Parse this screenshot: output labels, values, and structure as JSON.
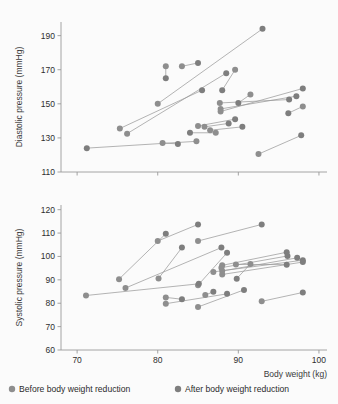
{
  "figure": {
    "width": 338,
    "height": 404,
    "background": "#fbfbfb",
    "marker_color_before": "#8e8e8e",
    "marker_color_after": "#7e7e7e",
    "link_color": "#9b9b9b",
    "axis_color": "#9a9a9a"
  },
  "legend": {
    "position": "bottom",
    "items": [
      {
        "label": "Before body weight reduction",
        "marker": "circle",
        "color": "#8e8e8e"
      },
      {
        "label": "After body weight reduction",
        "marker": "circle",
        "color": "#7e7e7e"
      }
    ]
  },
  "chart_data": [
    {
      "type": "scatter",
      "panel": "top",
      "title": "",
      "xlabel": "",
      "ylabel": "Diastolic pressure (mmHg)",
      "xlim": [
        68,
        101
      ],
      "ylim": [
        110,
        198
      ],
      "xticks": [
        70,
        80,
        90,
        100
      ],
      "xticklabels": [
        "",
        "",
        "",
        ""
      ],
      "yticks": [
        110,
        130,
        150,
        170,
        190
      ],
      "yticklabels": [
        "110",
        "130",
        "150",
        "170",
        "190"
      ],
      "grid": false,
      "series": [
        {
          "name": "Before body weight reduction",
          "role": "before"
        },
        {
          "name": "After body weight reduction",
          "role": "after"
        }
      ],
      "pairs": [
        {
          "before": [
            80.0,
            150.0
          ],
          "after": [
            93.0,
            194.0
          ]
        },
        {
          "before": [
            83.0,
            172.0
          ],
          "after": [
            85.0,
            174.0
          ]
        },
        {
          "before": [
            81.0,
            172.0
          ],
          "after": [
            81.0,
            165.0
          ]
        },
        {
          "before": [
            75.3,
            135.5
          ],
          "after": [
            85.5,
            158.0
          ]
        },
        {
          "before": [
            76.2,
            132.5
          ],
          "after": [
            88.5,
            168.0
          ]
        },
        {
          "before": [
            89.6,
            170.0
          ],
          "after": [
            88.0,
            158.0
          ]
        },
        {
          "before": [
            87.7,
            150.5
          ],
          "after": [
            96.3,
            152.5
          ]
        },
        {
          "before": [
            87.8,
            147.0
          ],
          "after": [
            97.2,
            154.5
          ]
        },
        {
          "before": [
            87.8,
            145.5
          ],
          "after": [
            98.0,
            159.0
          ]
        },
        {
          "before": [
            98.0,
            148.5
          ],
          "after": [
            96.2,
            144.5
          ]
        },
        {
          "before": [
            91.5,
            155.5
          ],
          "after": [
            90.0,
            150.5
          ]
        },
        {
          "before": [
            85.8,
            136.5
          ],
          "after": [
            88.8,
            138.5
          ]
        },
        {
          "before": [
            85.0,
            137.0
          ],
          "after": [
            89.6,
            141.0
          ]
        },
        {
          "before": [
            86.5,
            134.5
          ],
          "after": [
            90.5,
            136.5
          ]
        },
        {
          "before": [
            87.2,
            133.0
          ],
          "after": [
            84.0,
            133.0
          ]
        },
        {
          "before": [
            80.6,
            127.0
          ],
          "after": [
            82.5,
            126.5
          ]
        },
        {
          "before": [
            84.8,
            128.0
          ],
          "after": [
            71.2,
            124.0
          ]
        },
        {
          "before": [
            92.5,
            120.5
          ],
          "after": [
            97.8,
            131.5
          ]
        }
      ]
    },
    {
      "type": "scatter",
      "panel": "bottom",
      "title": "",
      "xlabel": "Body weight (kg)",
      "ylabel": "Systolic pressure (mmHg)",
      "xlim": [
        68,
        101
      ],
      "ylim": [
        60,
        122
      ],
      "xticks": [
        70,
        80,
        90,
        100
      ],
      "xticklabels": [
        "70",
        "80",
        "90",
        "100"
      ],
      "yticks": [
        60,
        70,
        80,
        90,
        100,
        110,
        120
      ],
      "yticklabels": [
        "60",
        "70",
        "80",
        "90",
        "100",
        "110",
        "120"
      ],
      "grid": false,
      "series": [
        {
          "name": "Before body weight reduction",
          "role": "before"
        },
        {
          "name": "After body weight reduction",
          "role": "after"
        }
      ],
      "pairs": [
        {
          "before": [
            75.2,
            90.3
          ],
          "after": [
            81.0,
            109.7
          ]
        },
        {
          "before": [
            80.0,
            106.6
          ],
          "after": [
            85.0,
            113.7
          ]
        },
        {
          "before": [
            80.1,
            90.6
          ],
          "after": [
            83.0,
            103.8
          ]
        },
        {
          "before": [
            85.0,
            106.6
          ],
          "after": [
            92.9,
            113.7
          ]
        },
        {
          "before": [
            76.0,
            86.5
          ],
          "after": [
            87.9,
            103.8
          ]
        },
        {
          "before": [
            85.0,
            87.7
          ],
          "after": [
            88.6,
            101.6
          ]
        },
        {
          "before": [
            88.0,
            96.2
          ],
          "after": [
            96.0,
            101.8
          ]
        },
        {
          "before": [
            87.9,
            95.2
          ],
          "after": [
            96.1,
            100.2
          ]
        },
        {
          "before": [
            88.0,
            93.8
          ],
          "after": [
            97.3,
            99.4
          ]
        },
        {
          "before": [
            86.9,
            93.4
          ],
          "after": [
            98.0,
            98.4
          ]
        },
        {
          "before": [
            88.0,
            92.3
          ],
          "after": [
            98.0,
            97.6
          ]
        },
        {
          "before": [
            89.7,
            96.6
          ],
          "after": [
            96.0,
            96.5
          ]
        },
        {
          "before": [
            91.5,
            96.8
          ],
          "after": [
            89.8,
            90.5
          ]
        },
        {
          "before": [
            71.1,
            83.3
          ],
          "after": [
            85.1,
            88.3
          ]
        },
        {
          "before": [
            85.9,
            83.5
          ],
          "after": [
            86.9,
            84.9
          ]
        },
        {
          "before": [
            81.0,
            82.5
          ],
          "after": [
            83.0,
            81.7
          ]
        },
        {
          "before": [
            81.0,
            79.8
          ],
          "after": [
            88.6,
            84.0
          ]
        },
        {
          "before": [
            85.0,
            78.4
          ],
          "after": [
            90.7,
            85.7
          ]
        },
        {
          "before": [
            92.9,
            80.8
          ],
          "after": [
            98.0,
            84.6
          ]
        }
      ]
    }
  ]
}
